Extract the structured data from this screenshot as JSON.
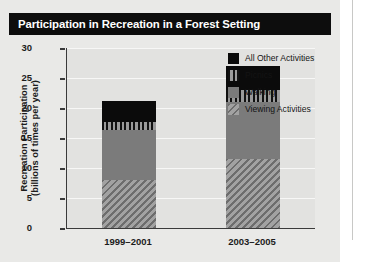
{
  "figure": {
    "title": "Participation in Recreation in a Forest Setting",
    "title_bg": "#0d0d0d",
    "title_color": "#ffffff",
    "panel_bg": "#e9e9e7",
    "plot_bg": "#e2e2e0"
  },
  "chart_data": {
    "type": "bar",
    "subtype": "stacked-vertical",
    "title": "Participation in Recreation in a Forest Setting",
    "xlabel": "",
    "ylabel": "Recreation Participation (billions of times per year)",
    "ylabel_line1": "Recreation Participation",
    "ylabel_line2": "(billions of times per year)",
    "categories": [
      "1999–2001",
      "2003–2005"
    ],
    "ylim": [
      0,
      30
    ],
    "yticks": [
      0,
      5,
      10,
      15,
      20,
      25,
      30
    ],
    "ytick_labels": [
      "0",
      "5",
      "10",
      "15",
      "20",
      "25",
      "30"
    ],
    "grid": true,
    "grid_axis": "y",
    "legend_position": "upper right",
    "stack_order_bottom_to_top": [
      "Viewing Activities",
      "Walking",
      "Picnics",
      "All Other Activities"
    ],
    "series": [
      {
        "name": "All Other Activities",
        "color": "#0b0b0b",
        "pattern": "solid",
        "values": [
          3.5,
          4.0
        ]
      },
      {
        "name": "Picnics",
        "color": "#6f6f6f",
        "pattern": "vertical-stripes",
        "values": [
          1.3,
          2.0
        ]
      },
      {
        "name": "Walking",
        "color": "#7b7b7b",
        "pattern": "solid",
        "values": [
          8.3,
          9.5
        ]
      },
      {
        "name": "Viewing Activities",
        "color": "#8a8a8a",
        "pattern": "diagonal-hatch",
        "values": [
          8.0,
          11.5
        ]
      }
    ],
    "totals": [
      21.1,
      27.0
    ],
    "bars": [
      {
        "category": "1999–2001",
        "total": 21.1,
        "segments": [
          {
            "label": "Viewing Activities",
            "value": 8.0,
            "from": 0.0,
            "to": 8.0
          },
          {
            "label": "Walking",
            "value": 8.3,
            "from": 8.0,
            "to": 16.3
          },
          {
            "label": "Picnics",
            "value": 1.3,
            "from": 16.3,
            "to": 17.6
          },
          {
            "label": "All Other Activities",
            "value": 3.5,
            "from": 17.6,
            "to": 21.1
          }
        ]
      },
      {
        "category": "2003–2005",
        "total": 27.0,
        "segments": [
          {
            "label": "Viewing Activities",
            "value": 11.5,
            "from": 0.0,
            "to": 11.5
          },
          {
            "label": "Walking",
            "value": 9.5,
            "from": 11.5,
            "to": 21.0
          },
          {
            "label": "Picnics",
            "value": 2.0,
            "from": 21.0,
            "to": 23.0
          },
          {
            "label": "All Other Activities",
            "value": 4.0,
            "from": 23.0,
            "to": 27.0
          }
        ]
      }
    ],
    "legend": [
      {
        "label": "All Other Activities",
        "color": "#0b0b0b",
        "pattern": "solid"
      },
      {
        "label": "Picnics",
        "color": "#6f6f6f",
        "pattern": "vertical-stripes"
      },
      {
        "label": "Walking",
        "color": "#7b7b7b",
        "pattern": "solid"
      },
      {
        "label": "Viewing Activities",
        "color": "#8a8a8a",
        "pattern": "diagonal-hatch"
      }
    ]
  }
}
